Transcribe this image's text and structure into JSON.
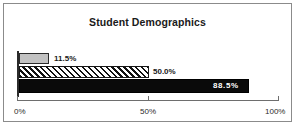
{
  "chart_data": {
    "type": "bar",
    "orientation": "horizontal",
    "title": "Student Demographics",
    "xlabel": "",
    "ylabel": "",
    "xlim": [
      0,
      100
    ],
    "grid": false,
    "legend": "none",
    "categories": [
      "Series 1",
      "Series 2",
      "Series 3"
    ],
    "values": [
      11.5,
      50.0,
      88.5
    ],
    "data_labels": [
      "11.5%",
      "50.0%",
      "88.5%"
    ],
    "tick_labels": [
      "0%",
      "50%",
      "100%"
    ],
    "tick_values": [
      0,
      50,
      100
    ],
    "bar_styles": [
      "solid-gray",
      "diagonal-hatch",
      "solid-black"
    ],
    "colors": {
      "bar_gray": "#c2c2c2",
      "bar_hatch_line": "#111111",
      "bar_black": "#0a0a0a",
      "outline": "#2b2b2b",
      "axis": "#6e6e6e",
      "frame": "#8b8b8b",
      "title_text": "#1a1a1a",
      "label_on_dark": "#ffffff",
      "background": "#ffffff"
    }
  }
}
